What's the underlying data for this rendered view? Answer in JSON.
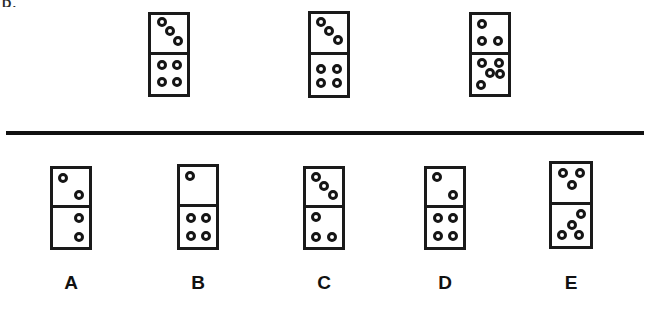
{
  "page": {
    "type": "domino-sequence-puzzle",
    "background_color": "#ffffff",
    "ink_color": "#1a1a1a",
    "corner_mark_text": "D.",
    "divider": {
      "x": 6,
      "y": 131,
      "width": 638,
      "height": 4,
      "color": "#111111"
    }
  },
  "prompt_row": {
    "name": "sequence-row",
    "dominoes": [
      {
        "id": "prompt-1",
        "x": 148,
        "y": 12,
        "width": 42,
        "height": 85,
        "top_value": 3,
        "bottom_value": 4,
        "top_pips": [
          [
            30,
            20
          ],
          [
            52,
            45
          ],
          [
            76,
            70
          ]
        ],
        "bottom_pips": [
          [
            30,
            26
          ],
          [
            72,
            26
          ],
          [
            30,
            70
          ],
          [
            72,
            70
          ]
        ]
      },
      {
        "id": "prompt-2",
        "x": 308,
        "y": 11,
        "width": 42,
        "height": 87,
        "top_value": 3,
        "bottom_value": 4,
        "top_pips": [
          [
            28,
            20
          ],
          [
            50,
            46
          ],
          [
            74,
            70
          ]
        ],
        "bottom_pips": [
          [
            28,
            36
          ],
          [
            28,
            70
          ],
          [
            72,
            36
          ],
          [
            72,
            70
          ]
        ]
      },
      {
        "id": "prompt-3",
        "x": 469,
        "y": 12,
        "width": 42,
        "height": 85,
        "top_value": 3,
        "bottom_value": 5,
        "top_pips": [
          [
            28,
            24
          ],
          [
            28,
            72
          ],
          [
            72,
            72
          ]
        ],
        "bottom_pips": [
          [
            28,
            22
          ],
          [
            74,
            22
          ],
          [
            50,
            48
          ],
          [
            26,
            76
          ],
          [
            78,
            50
          ]
        ]
      }
    ]
  },
  "options_row": {
    "name": "answer-options-row",
    "options": [
      {
        "id": "option-a",
        "label": "A",
        "x": 50,
        "y": 166,
        "width": 42,
        "height": 84,
        "label_x": 71,
        "label_y": 272,
        "top_value": 2,
        "bottom_value": 2,
        "top_pips": [
          [
            28,
            24
          ],
          [
            72,
            72
          ]
        ],
        "bottom_pips": [
          [
            72,
            26
          ],
          [
            72,
            74
          ]
        ]
      },
      {
        "id": "option-b",
        "label": "B",
        "x": 177,
        "y": 164,
        "width": 42,
        "height": 86,
        "label_x": 198,
        "label_y": 272,
        "top_value": 1,
        "bottom_value": 4,
        "top_pips": [
          [
            28,
            24
          ]
        ],
        "bottom_pips": [
          [
            30,
            28
          ],
          [
            72,
            28
          ],
          [
            30,
            72
          ],
          [
            72,
            72
          ]
        ]
      },
      {
        "id": "option-c",
        "label": "C",
        "x": 303,
        "y": 166,
        "width": 42,
        "height": 84,
        "label_x": 324,
        "label_y": 272,
        "top_value": 3,
        "bottom_value": 3,
        "top_pips": [
          [
            28,
            22
          ],
          [
            50,
            48
          ],
          [
            74,
            72
          ]
        ],
        "bottom_pips": [
          [
            28,
            24
          ],
          [
            28,
            74
          ],
          [
            72,
            74
          ]
        ]
      },
      {
        "id": "option-d",
        "label": "D",
        "x": 424,
        "y": 166,
        "width": 42,
        "height": 84,
        "label_x": 445,
        "label_y": 272,
        "top_value": 2,
        "bottom_value": 4,
        "top_pips": [
          [
            28,
            22
          ],
          [
            72,
            72
          ]
        ],
        "bottom_pips": [
          [
            30,
            26
          ],
          [
            72,
            26
          ],
          [
            30,
            72
          ],
          [
            72,
            72
          ]
        ]
      },
      {
        "id": "option-e",
        "label": "E",
        "x": 549,
        "y": 161,
        "width": 44,
        "height": 88,
        "label_x": 571,
        "label_y": 272,
        "top_value": 3,
        "bottom_value": 4,
        "top_pips": [
          [
            30,
            24
          ],
          [
            74,
            24
          ],
          [
            52,
            54
          ]
        ],
        "bottom_pips": [
          [
            76,
            22
          ],
          [
            52,
            48
          ],
          [
            26,
            72
          ],
          [
            72,
            74
          ]
        ]
      }
    ]
  }
}
